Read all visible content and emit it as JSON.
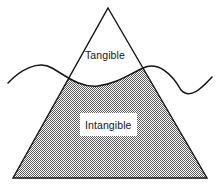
{
  "diagram": {
    "type": "triangle-waterline",
    "background_color": "#ffffff",
    "stroke_color": "#141414",
    "fill_pattern": "50% gray checkerboard dither",
    "fill_color": "#808080",
    "labels": {
      "above_waterline": "Tangible",
      "below_waterline": "Intangible"
    },
    "shapes": {
      "triangle": {
        "name": "triangle",
        "apex": [
          108,
          8
        ],
        "base_left": [
          13,
          178
        ],
        "base_right": [
          207,
          178
        ]
      },
      "waterline": {
        "name": "waterline",
        "start": [
          8,
          83
        ],
        "end": [
          212,
          77
        ],
        "crest_left": [
          50,
          67
        ],
        "trough_middle": [
          98,
          86
        ],
        "crest_right": [
          143,
          68
        ],
        "trough_right": [
          180,
          91
        ]
      }
    },
    "regions": [
      {
        "name": "tangible-region",
        "label": "Tangible",
        "position": "above waterline, inside triangle",
        "fill": "white"
      },
      {
        "name": "intangible-region",
        "label": "Intangible",
        "position": "below waterline, inside triangle",
        "fill": "gray dither"
      }
    ]
  }
}
